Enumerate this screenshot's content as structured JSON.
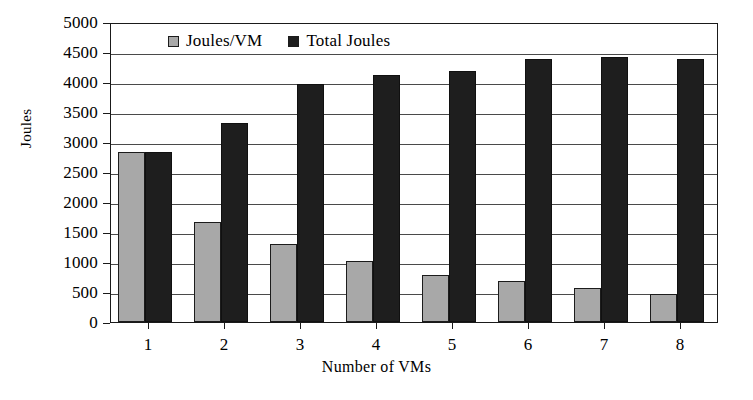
{
  "chart_data": {
    "type": "bar",
    "title": "",
    "xlabel": "Number of VMs",
    "ylabel": "Joules",
    "categories": [
      "1",
      "2",
      "3",
      "4",
      "5",
      "6",
      "7",
      "8"
    ],
    "series": [
      {
        "name": "Joules/VM",
        "color": "#a8a8a8",
        "values": [
          2830,
          1665,
          1300,
          1010,
          790,
          690,
          570,
          470
        ]
      },
      {
        "name": "Total Joules",
        "color": "#1e1e1e",
        "values": [
          2830,
          3310,
          3960,
          4120,
          4180,
          4390,
          4410,
          4390
        ]
      }
    ],
    "ylim": [
      0,
      5000
    ],
    "yticks": [
      0,
      500,
      1000,
      1500,
      2000,
      2500,
      3000,
      3500,
      4000,
      4500,
      5000
    ],
    "ytick_labels": [
      "0",
      "500",
      "1000",
      "1500",
      "2000",
      "2500",
      "3000",
      "3500",
      "4000",
      "4500",
      "5000"
    ],
    "gridlines": [
      500,
      1000,
      1500,
      2000,
      2500,
      3000,
      3500,
      4000,
      4500
    ],
    "grid": true,
    "legend_position": "top-left-inside"
  }
}
